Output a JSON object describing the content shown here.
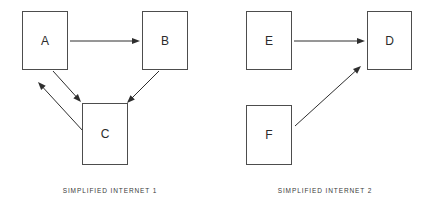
{
  "diagram": {
    "title_visible": false,
    "background_color": "#ffffff",
    "node_border_color": "#4d4d4d",
    "edge_color": "#2e2e2e",
    "text_color": "#2b2b2b",
    "caption_color": "#3a3a3a",
    "groups": [
      {
        "id": "simplified-internet-1",
        "caption": "SIMPLIFIED INTERNET 1",
        "caption_x": 110,
        "caption_y": 188,
        "nodes": [
          {
            "id": "A",
            "label": "A",
            "x": 22,
            "y": 11,
            "w": 46,
            "h": 59
          },
          {
            "id": "B",
            "label": "B",
            "x": 142,
            "y": 11,
            "w": 46,
            "h": 59
          },
          {
            "id": "C",
            "label": "C",
            "x": 82,
            "y": 103,
            "w": 46,
            "h": 62
          }
        ],
        "edges": [
          {
            "id": "a-to-b",
            "from": "A",
            "to": "B",
            "x1": 70,
            "y1": 41,
            "x2": 140,
            "y2": 41
          },
          {
            "id": "b-to-c",
            "from": "B",
            "to": "C",
            "x1": 159,
            "y1": 71,
            "x2": 127,
            "y2": 103
          },
          {
            "id": "a-to-c",
            "from": "A",
            "to": "C",
            "x1": 53,
            "y1": 71,
            "x2": 81,
            "y2": 102
          },
          {
            "id": "c-to-a",
            "from": "C",
            "to": "A",
            "x1": 83,
            "y1": 131,
            "x2": 38,
            "y2": 82
          }
        ]
      },
      {
        "id": "simplified-internet-2",
        "caption": "SIMPLIFIED INTERNET 2",
        "caption_x": 325,
        "caption_y": 188,
        "nodes": [
          {
            "id": "E",
            "label": "E",
            "x": 246,
            "y": 11,
            "w": 46,
            "h": 59
          },
          {
            "id": "D",
            "label": "D",
            "x": 367,
            "y": 11,
            "w": 45,
            "h": 59
          },
          {
            "id": "F",
            "label": "F",
            "x": 246,
            "y": 105,
            "w": 46,
            "h": 60
          }
        ],
        "edges": [
          {
            "id": "e-to-d",
            "from": "E",
            "to": "D",
            "x1": 294,
            "y1": 41,
            "x2": 365,
            "y2": 41
          },
          {
            "id": "f-to-d",
            "from": "F",
            "to": "D",
            "x1": 295,
            "y1": 126,
            "x2": 361,
            "y2": 66
          }
        ]
      }
    ]
  }
}
